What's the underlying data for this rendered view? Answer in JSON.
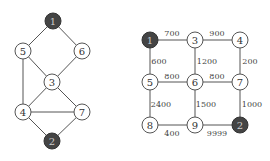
{
  "left_graph": {
    "nodes": [
      {
        "id": "1",
        "x": 53,
        "y": 21,
        "dark": true
      },
      {
        "id": "5",
        "x": 23,
        "y": 51,
        "dark": false
      },
      {
        "id": "6",
        "x": 82,
        "y": 51,
        "dark": false
      },
      {
        "id": "3",
        "x": 52,
        "y": 82,
        "dark": false
      },
      {
        "id": "4",
        "x": 23,
        "y": 112,
        "dark": false
      },
      {
        "id": "7",
        "x": 82,
        "y": 112,
        "dark": false
      },
      {
        "id": "2",
        "x": 52,
        "y": 141,
        "dark": true
      }
    ],
    "edges": [
      [
        "1",
        "5"
      ],
      [
        "1",
        "6"
      ],
      [
        "5",
        "3"
      ],
      [
        "6",
        "3"
      ],
      [
        "5",
        "4"
      ],
      [
        "3",
        "4"
      ],
      [
        "3",
        "7"
      ],
      [
        "4",
        "7"
      ],
      [
        "4",
        "2"
      ],
      [
        "7",
        "2"
      ]
    ]
  },
  "right_graph": {
    "nodes": [
      {
        "id": "1",
        "x": 150,
        "y": 40,
        "dark": true
      },
      {
        "id": "3",
        "x": 195,
        "y": 40,
        "dark": false
      },
      {
        "id": "4",
        "x": 240,
        "y": 40,
        "dark": false
      },
      {
        "id": "5",
        "x": 150,
        "y": 82,
        "dark": false
      },
      {
        "id": "6",
        "x": 195,
        "y": 82,
        "dark": false
      },
      {
        "id": "7",
        "x": 240,
        "y": 82,
        "dark": false
      },
      {
        "id": "8",
        "x": 150,
        "y": 125,
        "dark": false
      },
      {
        "id": "9",
        "x": 195,
        "y": 125,
        "dark": false
      },
      {
        "id": "2",
        "x": 240,
        "y": 125,
        "dark": true
      }
    ],
    "edges": [
      {
        "a": "1",
        "b": "3",
        "w": "700",
        "lx": 172,
        "ly": 33
      },
      {
        "a": "3",
        "b": "4",
        "w": "900",
        "lx": 217,
        "ly": 33
      },
      {
        "a": "1",
        "b": "5",
        "w": "600",
        "lx": 159,
        "ly": 61
      },
      {
        "a": "3",
        "b": "6",
        "w": "1200",
        "lx": 207,
        "ly": 61
      },
      {
        "a": "4",
        "b": "7",
        "w": "200",
        "lx": 250,
        "ly": 61
      },
      {
        "a": "5",
        "b": "6",
        "w": "800",
        "lx": 172,
        "ly": 76
      },
      {
        "a": "6",
        "b": "7",
        "w": "800",
        "lx": 217,
        "ly": 76
      },
      {
        "a": "5",
        "b": "8",
        "w": "2400",
        "lx": 161,
        "ly": 104
      },
      {
        "a": "6",
        "b": "9",
        "w": "1500",
        "lx": 206,
        "ly": 104
      },
      {
        "a": "7",
        "b": "2",
        "w": "1000",
        "lx": 252,
        "ly": 104
      },
      {
        "a": "8",
        "b": "9",
        "w": "400",
        "lx": 172,
        "ly": 133
      },
      {
        "a": "9",
        "b": "2",
        "w": "9999",
        "lx": 217,
        "ly": 133
      }
    ]
  }
}
